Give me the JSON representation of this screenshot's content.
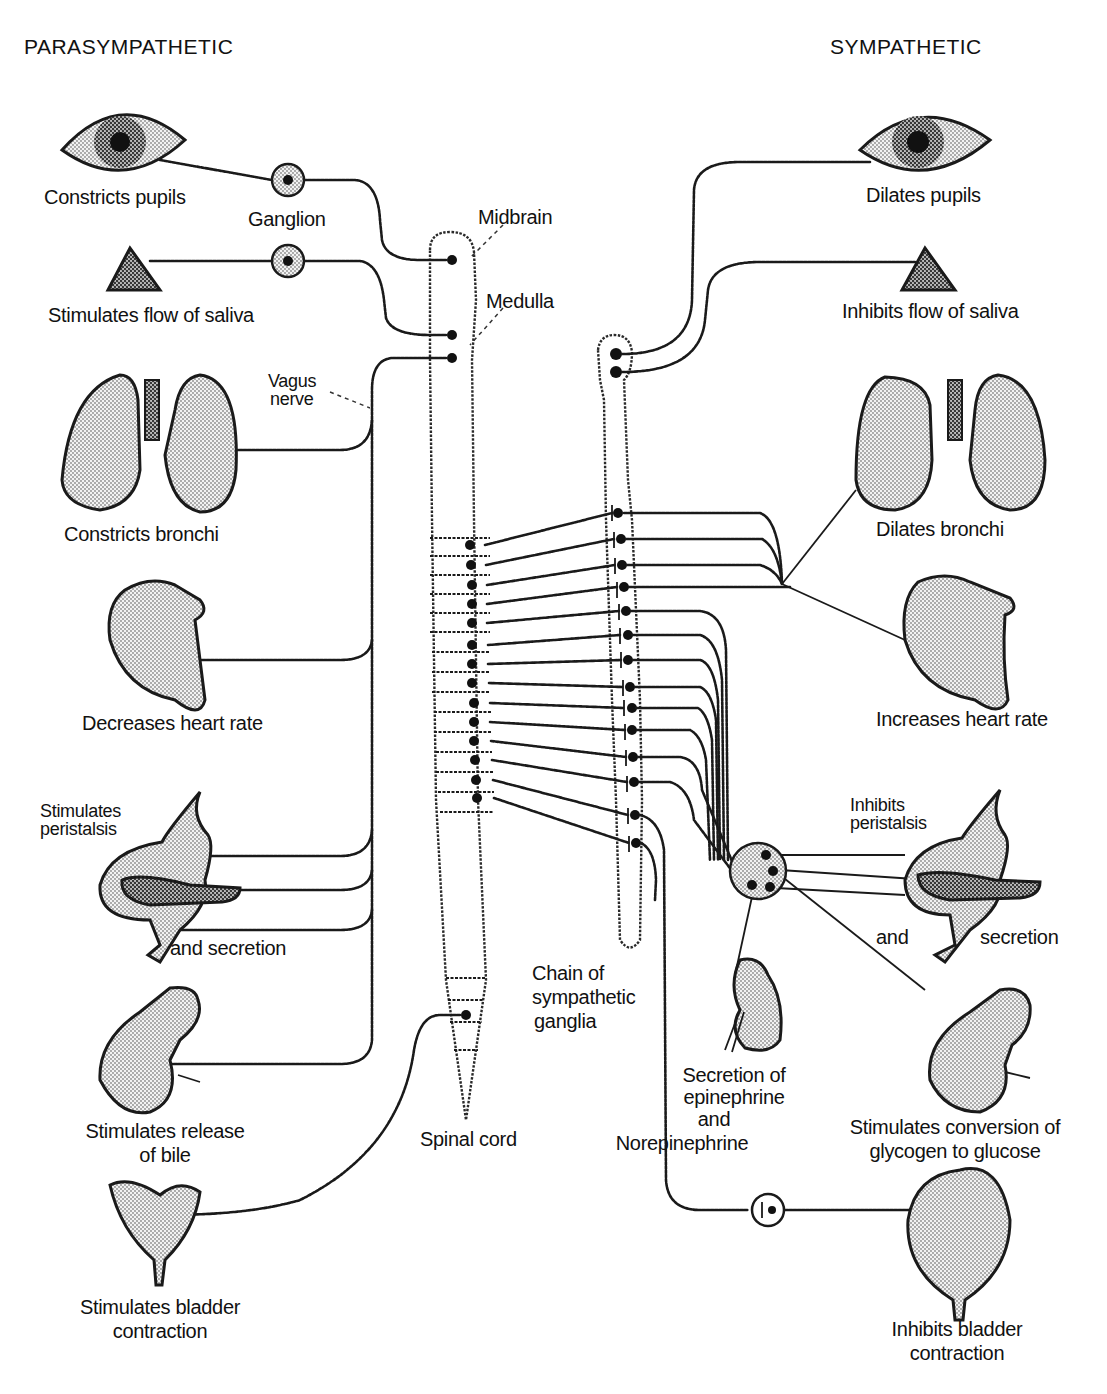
{
  "diagram": {
    "title_left": "PARASYMPATHETIC",
    "title_right": "SYMPATHETIC",
    "center_labels": {
      "ganglion": "Ganglion",
      "midbrain": "Midbrain",
      "medulla": "Medulla",
      "vagus_nerve_line1": "Vagus",
      "vagus_nerve_line2": "nerve",
      "spinal_cord": "Spinal cord",
      "chain_line1": "Chain of",
      "chain_line2": "sympathetic",
      "chain_line3": "ganglia"
    },
    "parasympathetic": [
      {
        "organ": "eye",
        "lines": [
          "Constricts pupils"
        ]
      },
      {
        "organ": "salivary-gland",
        "lines": [
          "Stimulates flow of saliva"
        ]
      },
      {
        "organ": "lungs",
        "lines": [
          "Constricts bronchi"
        ]
      },
      {
        "organ": "heart",
        "lines": [
          "Decreases heart rate"
        ]
      },
      {
        "organ": "stomach-pancreas",
        "lines": [
          "Stimulates",
          "peristalsis"
        ],
        "extra": "and secretion"
      },
      {
        "organ": "liver",
        "lines": [
          "Stimulates release",
          "of bile"
        ]
      },
      {
        "organ": "bladder",
        "lines": [
          "Stimulates bladder",
          "contraction"
        ]
      }
    ],
    "sympathetic": [
      {
        "organ": "eye",
        "lines": [
          "Dilates pupils"
        ]
      },
      {
        "organ": "salivary-gland",
        "lines": [
          "Inhibits flow of saliva"
        ]
      },
      {
        "organ": "lungs",
        "lines": [
          "Dilates bronchi"
        ]
      },
      {
        "organ": "heart",
        "lines": [
          "Increases heart rate"
        ]
      },
      {
        "organ": "stomach-pancreas",
        "lines": [
          "Inhibits",
          "peristalsis"
        ],
        "extra_left": "and",
        "extra_right": "secretion"
      },
      {
        "organ": "adrenal-kidney",
        "lines": [
          "Secretion of",
          "epinephrine",
          "and",
          "Norepinephrine"
        ]
      },
      {
        "organ": "liver",
        "lines": [
          "Stimulates conversion of",
          "glycogen to glucose"
        ]
      },
      {
        "organ": "bladder",
        "lines": [
          "Inhibits bladder",
          "contraction"
        ]
      }
    ],
    "colors": {
      "ink": "#111111",
      "background": "#ffffff",
      "stipple": "#9a9a9a"
    }
  }
}
